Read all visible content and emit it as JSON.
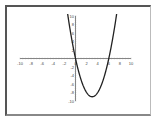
{
  "chart_data": {
    "type": "line",
    "title": "",
    "xlabel": "",
    "ylabel": "",
    "function": "y = x^2 - 6x",
    "xlim": [
      -10,
      10
    ],
    "ylim": [
      -10,
      10
    ],
    "grid": false,
    "x_ticks": [
      -10,
      -8,
      -6,
      -4,
      -2,
      0,
      2,
      4,
      6,
      8,
      10
    ],
    "y_ticks": [
      -10,
      -8,
      -6,
      -4,
      -2,
      2,
      4,
      6,
      8,
      10
    ],
    "x_tick_labels": [
      "-10",
      "-8",
      "-6",
      "-4",
      "-2",
      "0",
      "2",
      "4",
      "6",
      "8",
      "10"
    ],
    "y_tick_labels": [
      "-10",
      "-8",
      "-6",
      "-4",
      "-2",
      "2",
      "4",
      "6",
      "8",
      "10"
    ],
    "series": [
      {
        "name": "parabola",
        "x": [
          -1.5,
          -1,
          -0.5,
          0,
          0.5,
          1,
          1.5,
          2,
          2.5,
          3,
          3.5,
          4,
          4.5,
          5,
          5.5,
          6,
          6.5,
          7,
          7.5
        ],
        "y": [
          11.25,
          7,
          3.25,
          0,
          -2.75,
          -5,
          -6.75,
          -8,
          -8.75,
          -9,
          -8.75,
          -8,
          -6.75,
          -5,
          -2.75,
          0,
          3.25,
          7,
          11.25
        ]
      }
    ],
    "vertex": [
      3,
      -9
    ],
    "roots": [
      0,
      6
    ]
  }
}
